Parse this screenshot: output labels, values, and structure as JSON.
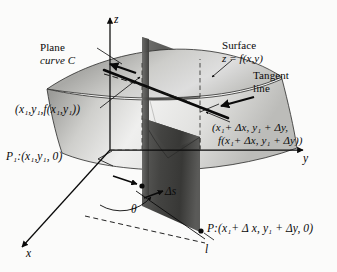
{
  "figure": {
    "background_color": "#fbfbfa",
    "ink_color": "#0a0a0a"
  },
  "axes": {
    "z_label": "z",
    "y_label": "y",
    "x_label": "x",
    "line_label": "l"
  },
  "annotations": {
    "plane_curve_line1": "Plane",
    "plane_curve_line2": "curve C",
    "surface_line1": "Surface",
    "surface_line2": "z = f(x,y)",
    "tangent_line1": "Tangent",
    "tangent_line2": "line",
    "delta_s": "Δs",
    "theta": "θ"
  },
  "points": {
    "upper_left_point": "(x₁,y₁,f(x₁,y₁))",
    "upper_right_line1": "(x₁+ Δx, y₁ + Δy,",
    "upper_right_line2": "f(x₁+ Δx, y₁ + Δy))",
    "p1_base": "P₁:(x₁,y₁, 0)",
    "p_base": "P:(x₁+ Δ x, y₁ + Δy, 0)"
  },
  "colors": {
    "surface_light": "#e9e9e7",
    "surface_mid": "#b9b9b6",
    "surface_dark": "#8f8f8c",
    "plane_dark": "#4a4a48",
    "plane_mid": "#6e6e6b",
    "line": "#0a0a0a"
  }
}
